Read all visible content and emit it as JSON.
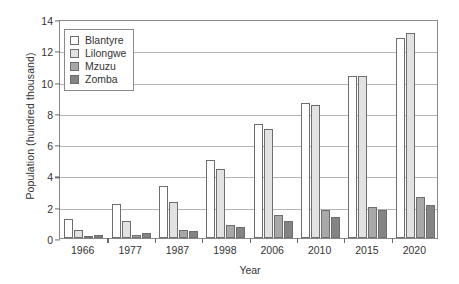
{
  "chart_data": {
    "type": "bar",
    "title": "",
    "subtitle": "",
    "xlabel": "Year",
    "ylabel": "Population (hundred thousand)",
    "categories": [
      "1966",
      "1977",
      "1987",
      "1998",
      "2006",
      "2010",
      "2015",
      "2020"
    ],
    "series": [
      {
        "name": "Blantyre",
        "color": "#fefefe",
        "values": [
          1.2,
          2.2,
          3.3,
          5.0,
          7.3,
          8.65,
          10.35,
          12.8
        ]
      },
      {
        "name": "Lilongwe",
        "color": "#e2e2e2",
        "values": [
          0.5,
          1.1,
          2.3,
          4.4,
          7.0,
          8.5,
          10.35,
          13.1
        ]
      },
      {
        "name": "Mzuzu",
        "color": "#a8a8a8",
        "values": [
          0.1,
          0.2,
          0.5,
          0.85,
          1.5,
          1.8,
          2.0,
          2.65
        ]
      },
      {
        "name": "Zomba",
        "color": "#848484",
        "values": [
          0.2,
          0.35,
          0.45,
          0.7,
          1.1,
          1.35,
          1.8,
          2.1
        ]
      }
    ],
    "ylim": [
      0,
      14
    ],
    "yticks": [
      0,
      2,
      4,
      6,
      8,
      10,
      12,
      14
    ],
    "ytick_labels": [
      "0",
      "2",
      "4",
      "6",
      "8",
      "10",
      "12",
      "14"
    ],
    "grid": true,
    "legend_position": "top-left",
    "legend_entries": [
      "Blantyre",
      "Lilongwe",
      "Mzuzu",
      "Zomba"
    ]
  }
}
